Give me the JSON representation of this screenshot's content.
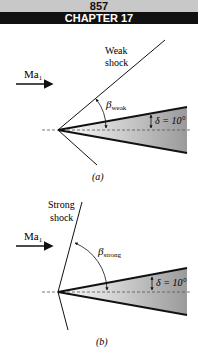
{
  "header": {
    "page_number": "857",
    "chapter": "CHAPTER 17"
  },
  "figure_a": {
    "shock_label_line1": "Weak",
    "shock_label_line2": "shock",
    "mach_label": "Ma",
    "mach_sub": "1",
    "beta_label": "β",
    "beta_sub": "weak",
    "delta_label": "δ = 10°",
    "caption": "(a)"
  },
  "figure_b": {
    "shock_label_line1": "Strong",
    "shock_label_line2": "shock",
    "mach_label": "Ma",
    "mach_sub": "1",
    "beta_label": "β",
    "beta_sub": "strong",
    "delta_label": "δ = 10°",
    "caption": "(b)"
  },
  "colors": {
    "line": "#111111",
    "wedge_fill_dark": "#9a9a9a",
    "header_gray": "#c8c8c8",
    "header_black": "#111111"
  }
}
